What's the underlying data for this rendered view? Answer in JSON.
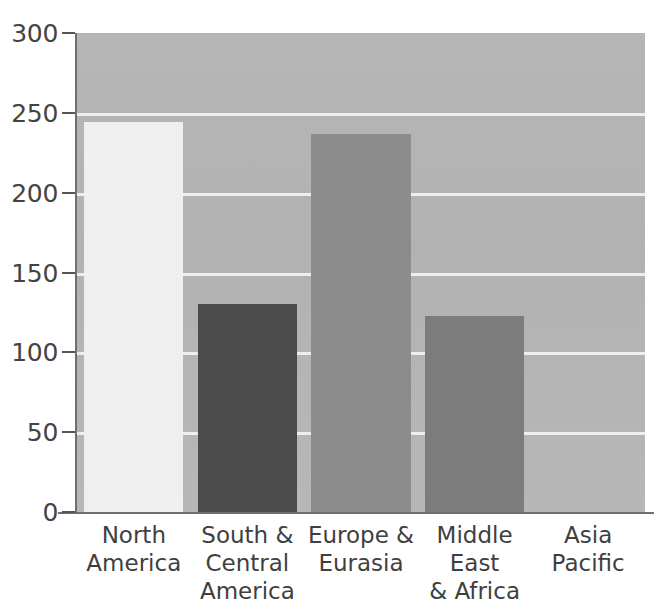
{
  "chart_data": {
    "type": "bar",
    "title": "",
    "subtitle": "",
    "xlabel": "",
    "ylabel": "",
    "categories": [
      "North\nAmerica",
      "South &\nCentral\nAmerica",
      "Europe &\nEurasia",
      "Middle East\n& Africa",
      "Asia\nPacific"
    ],
    "values": [
      244,
      130,
      237,
      123,
      0
    ],
    "bar_colors": [
      "#efefef",
      "#4b4b4b",
      "#8c8c8c",
      "#7c7c7c",
      "#b4b4b4"
    ],
    "ylim": [
      0,
      300
    ],
    "yticks": [
      0,
      50,
      100,
      150,
      200,
      250,
      300
    ],
    "ytick_labels": [
      "0",
      "50",
      "100",
      "150",
      "200",
      "250",
      "300"
    ],
    "grid": true,
    "gridline_color": "#f3f3f3",
    "plot_background": "#b3b3b3",
    "legend": null,
    "legend_position": "none",
    "annotations": []
  },
  "axis": {
    "axis_line_color": "#6f6f6f",
    "tick_color": "#555555",
    "label_color": "#444444"
  }
}
